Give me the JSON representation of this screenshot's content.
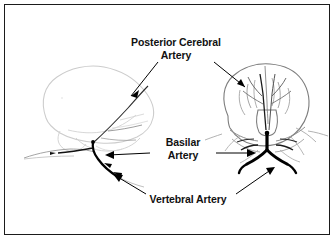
{
  "figure": {
    "kind": "anatomical-line-diagram",
    "background_color": "#ffffff",
    "frame_color": "#1b1b1b",
    "text_color": "#111111",
    "artery_color": "#000000",
    "brain_outline_left_color": "#c9c9c9",
    "brain_outline_right_color": "#7a7a7a",
    "leader_color": "#000000"
  },
  "labels": {
    "posterior_cerebral": {
      "line1": "Posterior Cerebral",
      "line2": "Artery"
    },
    "basilar": {
      "line1": "Basilar",
      "line2": "Artery"
    },
    "vertebral": {
      "line1": "Vertebral Artery"
    }
  },
  "views": {
    "left": {
      "name": "lateral-view",
      "description": "Side (lateral) view of brain with vertebrobasilar arteries"
    },
    "right": {
      "name": "posterior-view",
      "description": "Posterior (occipital) view of brain with basilar bifurcation"
    }
  },
  "leaders": [
    {
      "name": "leader-pca-left",
      "from": "posterior_cerebral",
      "to": "left-occipital-artery"
    },
    {
      "name": "leader-pca-right",
      "from": "posterior_cerebral",
      "to": "right-posterior-cerebral"
    },
    {
      "name": "leader-basilar-left",
      "from": "basilar",
      "to": "left-basilar-trunk"
    },
    {
      "name": "leader-basilar-right",
      "from": "basilar",
      "to": "right-basilar-trunk"
    },
    {
      "name": "leader-vertebral-left",
      "from": "vertebral",
      "to": "left-vertebral-artery"
    },
    {
      "name": "leader-vertebral-right",
      "from": "vertebral",
      "to": "right-vertebral-artery"
    }
  ]
}
